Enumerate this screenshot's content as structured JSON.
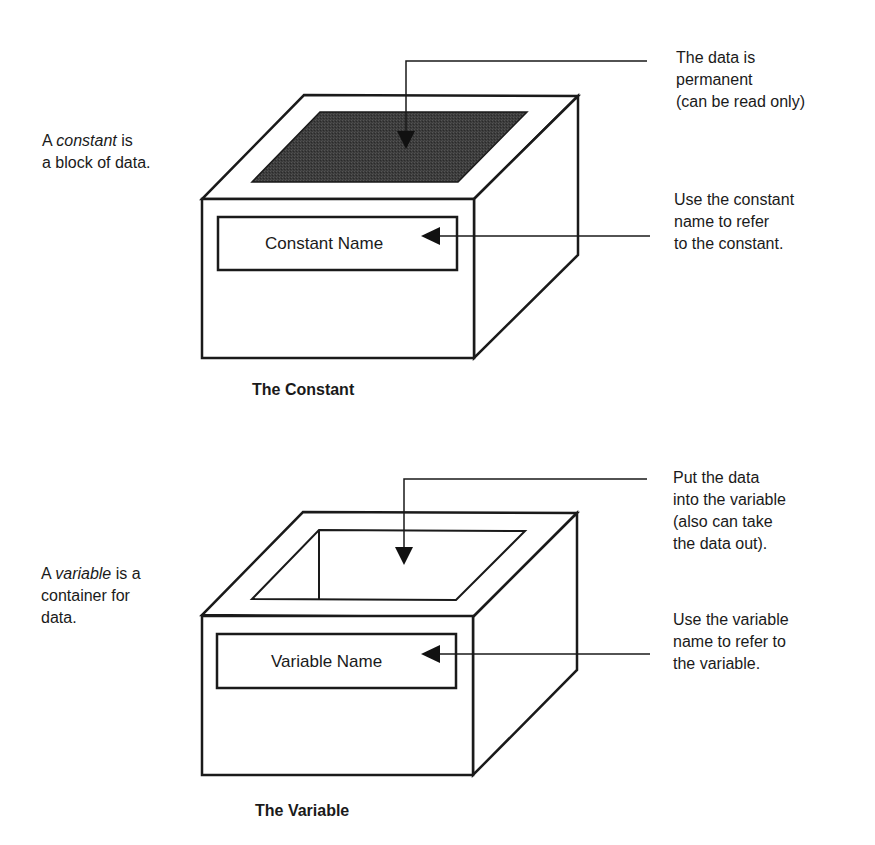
{
  "constant": {
    "left_note": {
      "prefix": "A ",
      "term": "constant",
      "suffix": " is",
      "line2": "a block of data."
    },
    "box_label": "Constant Name",
    "note_top": [
      "The data is",
      "permanent",
      "(can be read only)"
    ],
    "note_label": [
      "Use the constant",
      "name to refer",
      "to the constant."
    ],
    "caption": "The Constant",
    "fill_color": "#3a3a3a"
  },
  "variable": {
    "left_note": {
      "prefix": "A ",
      "term": "variable",
      "suffix": " is a",
      "line2": "container for",
      "line3": "data."
    },
    "box_label": "Variable Name",
    "note_top": [
      "Put the data",
      "into the variable",
      "(also can take",
      "the data out)."
    ],
    "note_label": [
      "Use the variable",
      "name to refer to",
      "the variable."
    ],
    "caption": "The Variable"
  },
  "colors": {
    "stroke": "#1a1a1a",
    "background": "#ffffff"
  }
}
